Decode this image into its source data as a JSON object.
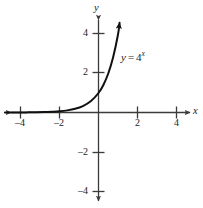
{
  "chart_data": {
    "type": "line",
    "title": "",
    "subtitle": "",
    "xlabel": "x",
    "ylabel": "y",
    "xlim": [
      -4.8,
      4.8
    ],
    "ylim": [
      -5.0,
      5.0
    ],
    "grid": false,
    "legend": "none",
    "annotations": [
      {
        "name": "curve-equation",
        "lhs": "y",
        "operator": "=",
        "base": "4",
        "exponent": "x",
        "full_text": "y = 4^x",
        "x": 1.05,
        "y": 2.8
      }
    ],
    "axes": {
      "x_ticks": [
        -4,
        -2,
        2,
        4
      ],
      "x_tick_labels": [
        "–4",
        "–2",
        "2",
        "4"
      ],
      "y_ticks": [
        -4,
        -2,
        2,
        4
      ],
      "y_tick_labels": [
        "–4",
        "–2",
        "2",
        "4"
      ],
      "x_arrows": [
        "left",
        "right"
      ],
      "y_arrows": [
        "up",
        "down"
      ],
      "axis_color": "#3b3b3b"
    },
    "series": [
      {
        "name": "y = 4^x",
        "color": "#111111",
        "line_width": 2,
        "arrow_end": "up-right",
        "asymptote": "y = 0",
        "x": [
          -4.8,
          -4.4,
          -4.0,
          -3.6,
          -3.2,
          -2.8,
          -2.4,
          -2.0,
          -1.6,
          -1.2,
          -0.8,
          -0.4,
          0.0,
          0.25,
          0.5,
          0.75,
          1.0,
          1.08
        ],
        "y": [
          0.0008,
          0.0013,
          0.0039,
          0.0069,
          0.0122,
          0.0215,
          0.0381,
          0.0625,
          0.1088,
          0.1895,
          0.3299,
          0.5743,
          1.0,
          1.414,
          2.0,
          2.828,
          4.0,
          4.6
        ]
      }
    ]
  },
  "labels": {
    "x_axis_name": "x",
    "y_axis_name": "y",
    "x_tick_neg4": "–4",
    "x_tick_neg2": "–2",
    "x_tick_pos2": "2",
    "x_tick_pos4": "4",
    "y_tick_pos4": "4",
    "y_tick_pos2": "2",
    "y_tick_neg2": "–2",
    "y_tick_neg4": "–4",
    "equation_lhs": "y",
    "equation_operator": "=",
    "equation_base": "4",
    "equation_exponent": "x"
  }
}
